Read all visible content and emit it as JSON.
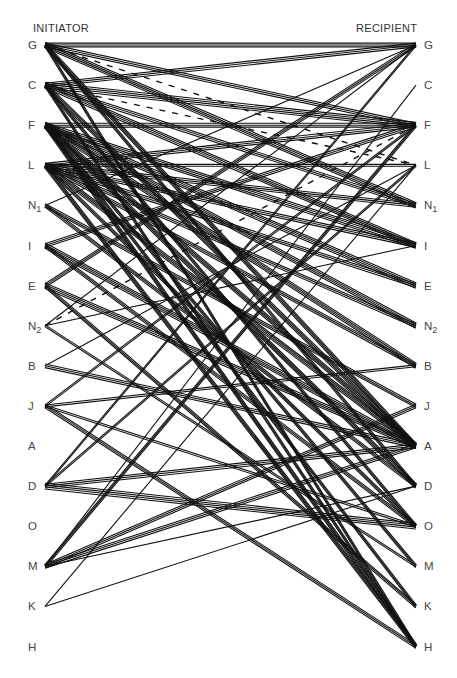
{
  "headers": {
    "initiator": "INITIATOR",
    "recipient": "RECIPIENT"
  },
  "nodes": [
    {
      "id": "G",
      "label": "G",
      "sub": ""
    },
    {
      "id": "C",
      "label": "C",
      "sub": ""
    },
    {
      "id": "F",
      "label": "F",
      "sub": ""
    },
    {
      "id": "L",
      "label": "L",
      "sub": ""
    },
    {
      "id": "N1",
      "label": "N",
      "sub": "1"
    },
    {
      "id": "I",
      "label": "I",
      "sub": ""
    },
    {
      "id": "E",
      "label": "E",
      "sub": ""
    },
    {
      "id": "N2",
      "label": "N",
      "sub": "2"
    },
    {
      "id": "B",
      "label": "B",
      "sub": ""
    },
    {
      "id": "J",
      "label": "J",
      "sub": ""
    },
    {
      "id": "A",
      "label": "A",
      "sub": ""
    },
    {
      "id": "D",
      "label": "D",
      "sub": ""
    },
    {
      "id": "O",
      "label": "O",
      "sub": ""
    },
    {
      "id": "M",
      "label": "M",
      "sub": ""
    },
    {
      "id": "K",
      "label": "K",
      "sub": ""
    },
    {
      "id": "H",
      "label": "H",
      "sub": ""
    }
  ],
  "edges": [
    {
      "from": "G",
      "to": "G",
      "count": 3
    },
    {
      "from": "G",
      "to": "F",
      "count": 3
    },
    {
      "from": "G",
      "to": "N1",
      "count": 4
    },
    {
      "from": "G",
      "to": "A",
      "count": 4
    },
    {
      "from": "G",
      "to": "H",
      "count": 3
    },
    {
      "from": "G",
      "to": "D",
      "count": 3
    },
    {
      "from": "G",
      "to": "L",
      "count": 1,
      "dashed": true
    },
    {
      "from": "C",
      "to": "G",
      "count": 3
    },
    {
      "from": "C",
      "to": "F",
      "count": 4
    },
    {
      "from": "C",
      "to": "N1",
      "count": 3
    },
    {
      "from": "C",
      "to": "I",
      "count": 4
    },
    {
      "from": "C",
      "to": "A",
      "count": 4
    },
    {
      "from": "C",
      "to": "O",
      "count": 3
    },
    {
      "from": "C",
      "to": "H",
      "count": 3
    },
    {
      "from": "C",
      "to": "L",
      "count": 1,
      "dashed": true
    },
    {
      "from": "F",
      "to": "F",
      "count": 3
    },
    {
      "from": "F",
      "to": "I",
      "count": 4
    },
    {
      "from": "F",
      "to": "E",
      "count": 4
    },
    {
      "from": "F",
      "to": "N2",
      "count": 4
    },
    {
      "from": "F",
      "to": "B",
      "count": 4
    },
    {
      "from": "F",
      "to": "A",
      "count": 4
    },
    {
      "from": "F",
      "to": "D",
      "count": 4
    },
    {
      "from": "F",
      "to": "M",
      "count": 3
    },
    {
      "from": "F",
      "to": "K",
      "count": 3
    },
    {
      "from": "F",
      "to": "H",
      "count": 4
    },
    {
      "from": "L",
      "to": "F",
      "count": 3
    },
    {
      "from": "L",
      "to": "L",
      "count": 2
    },
    {
      "from": "L",
      "to": "N1",
      "count": 3
    },
    {
      "from": "L",
      "to": "I",
      "count": 3
    },
    {
      "from": "L",
      "to": "E",
      "count": 3
    },
    {
      "from": "L",
      "to": "N2",
      "count": 3
    },
    {
      "from": "L",
      "to": "B",
      "count": 3
    },
    {
      "from": "L",
      "to": "A",
      "count": 4
    },
    {
      "from": "L",
      "to": "O",
      "count": 3
    },
    {
      "from": "L",
      "to": "H",
      "count": 4
    },
    {
      "from": "N1",
      "to": "G",
      "count": 1
    },
    {
      "from": "N1",
      "to": "J",
      "count": 3
    },
    {
      "from": "N1",
      "to": "D",
      "count": 3
    },
    {
      "from": "I",
      "to": "F",
      "count": 3
    },
    {
      "from": "I",
      "to": "A",
      "count": 4
    },
    {
      "from": "I",
      "to": "O",
      "count": 3
    },
    {
      "from": "E",
      "to": "G",
      "count": 3
    },
    {
      "from": "E",
      "to": "A",
      "count": 4
    },
    {
      "from": "E",
      "to": "K",
      "count": 3
    },
    {
      "from": "N2",
      "to": "G",
      "count": 1
    },
    {
      "from": "N2",
      "to": "I",
      "count": 1
    },
    {
      "from": "N2",
      "to": "M",
      "count": 2
    },
    {
      "from": "N2",
      "to": "F",
      "count": 1,
      "dashed": true
    },
    {
      "from": "B",
      "to": "A",
      "count": 3
    },
    {
      "from": "B",
      "to": "L",
      "count": 1
    },
    {
      "from": "J",
      "to": "B",
      "count": 2
    },
    {
      "from": "J",
      "to": "F",
      "count": 2
    },
    {
      "from": "J",
      "to": "H",
      "count": 3
    },
    {
      "from": "J",
      "to": "O",
      "count": 2
    },
    {
      "from": "D",
      "to": "A",
      "count": 3
    },
    {
      "from": "D",
      "to": "O",
      "count": 4
    },
    {
      "from": "D",
      "to": "G",
      "count": 2
    },
    {
      "from": "D",
      "to": "L",
      "count": 2
    },
    {
      "from": "M",
      "to": "J",
      "count": 3
    },
    {
      "from": "M",
      "to": "A",
      "count": 3
    },
    {
      "from": "M",
      "to": "F",
      "count": 3
    },
    {
      "from": "M",
      "to": "C",
      "count": 1
    },
    {
      "from": "M",
      "to": "D",
      "count": 1
    },
    {
      "from": "K",
      "to": "D",
      "count": 1
    },
    {
      "from": "K",
      "to": "L",
      "count": 1
    }
  ]
}
